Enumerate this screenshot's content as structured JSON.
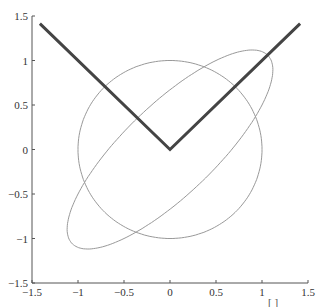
{
  "chart_data": {
    "type": "line",
    "title": "",
    "xlabel": "",
    "ylabel": "",
    "xlim": [
      -1.5,
      1.5
    ],
    "ylim": [
      -1.5,
      1.5
    ],
    "grid": false,
    "legend": null,
    "x_ticks": [
      "−1.5",
      "−1",
      "−0.5",
      "0",
      "0.5",
      "1",
      "1.5"
    ],
    "y_ticks": [
      "−1.5",
      "−1",
      "−0.5",
      "0",
      "0.5",
      "1",
      "1.5"
    ],
    "series": [
      {
        "name": "unit circle",
        "shape": "circle",
        "center": [
          0,
          0
        ],
        "radius": 1,
        "color": "#999999",
        "width": 1
      },
      {
        "name": "transformed ellipse",
        "shape": "ellipse",
        "matrix": [
          [
            1,
            0.5
          ],
          [
            0.5,
            1
          ]
        ],
        "note": "image of unit circle, major axis along y=x (semi-axis 1.5), minor axis along y=-x (semi-axis 0.5)",
        "color": "#999999",
        "width": 1
      },
      {
        "name": "V lines",
        "shape": "polyline",
        "x": [
          -1.414,
          0,
          1.414
        ],
        "y": [
          1.414,
          0,
          1.414
        ],
        "color": "#444444",
        "width": 3
      }
    ]
  },
  "footer": {
    "bracket": "[ ]"
  }
}
